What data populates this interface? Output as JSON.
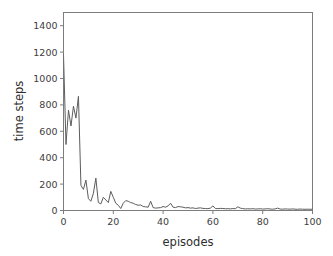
{
  "chart_data": {
    "type": "line",
    "title": "",
    "xlabel": "episodes",
    "ylabel": "time steps",
    "xlim": [
      0,
      100
    ],
    "ylim": [
      0,
      1500
    ],
    "xticks": [
      0,
      20,
      40,
      60,
      80,
      100
    ],
    "yticks": [
      0,
      200,
      400,
      600,
      800,
      1000,
      1200,
      1400
    ],
    "xtick_labels": [
      "0",
      "20",
      "40",
      "60",
      "80",
      "100"
    ],
    "ytick_labels": [
      "0",
      "200",
      "400",
      "600",
      "800",
      "1000",
      "1200",
      "1400"
    ],
    "grid": false,
    "legend": null,
    "line_color": "#5c5c5c",
    "spine_color": "#7d7d7d",
    "background_color": "#ffffff",
    "series": [
      {
        "name": "time steps per episode",
        "x": [
          0,
          1,
          2,
          3,
          4,
          5,
          6,
          7,
          8,
          9,
          10,
          11,
          12,
          13,
          14,
          15,
          16,
          17,
          18,
          19,
          20,
          21,
          22,
          23,
          24,
          25,
          26,
          27,
          28,
          29,
          30,
          31,
          32,
          33,
          34,
          35,
          36,
          37,
          38,
          39,
          40,
          41,
          42,
          43,
          44,
          45,
          46,
          47,
          48,
          49,
          50,
          51,
          52,
          53,
          54,
          55,
          56,
          57,
          58,
          59,
          60,
          61,
          62,
          63,
          64,
          65,
          66,
          67,
          68,
          69,
          70,
          71,
          72,
          73,
          74,
          75,
          76,
          77,
          78,
          79,
          80,
          81,
          82,
          83,
          84,
          85,
          86,
          87,
          88,
          89,
          90,
          91,
          92,
          93,
          94,
          95,
          96,
          97,
          98,
          99,
          100
        ],
        "values": [
          1180,
          500,
          760,
          640,
          790,
          700,
          865,
          190,
          160,
          230,
          90,
          70,
          130,
          245,
          60,
          50,
          100,
          80,
          60,
          145,
          100,
          55,
          40,
          15,
          55,
          75,
          70,
          60,
          55,
          45,
          40,
          42,
          30,
          28,
          25,
          70,
          22,
          18,
          20,
          22,
          30,
          25,
          35,
          55,
          25,
          22,
          30,
          28,
          25,
          20,
          22,
          18,
          20,
          15,
          18,
          20,
          16,
          15,
          14,
          18,
          35,
          15,
          14,
          16,
          15,
          13,
          14,
          12,
          15,
          13,
          28,
          18,
          14,
          12,
          13,
          12,
          14,
          11,
          12,
          13,
          11,
          12,
          14,
          11,
          10,
          12,
          18,
          11,
          10,
          12,
          11,
          10,
          12,
          10,
          9,
          11,
          10,
          9,
          10,
          9,
          10
        ]
      }
    ]
  },
  "axis_titles": {
    "x": "episodes",
    "y": "time steps"
  }
}
